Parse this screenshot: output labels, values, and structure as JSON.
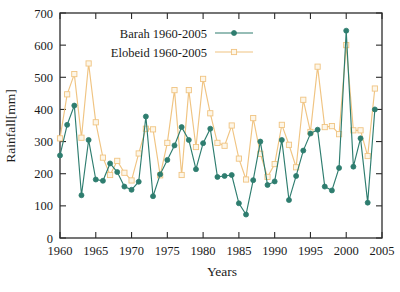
{
  "chart_data": {
    "type": "line",
    "title": "",
    "xlabel": "Years",
    "ylabel": "Rainfall[mm]",
    "xlim": [
      1960,
      2005
    ],
    "ylim": [
      0,
      700
    ],
    "xticks": [
      1960,
      1965,
      1970,
      1975,
      1980,
      1985,
      1990,
      1995,
      2000,
      2005
    ],
    "yticks": [
      0,
      100,
      200,
      300,
      400,
      500,
      600,
      700
    ],
    "grid": false,
    "legend_position": "top-left-inside",
    "x": [
      1960,
      1961,
      1962,
      1963,
      1964,
      1965,
      1966,
      1967,
      1968,
      1969,
      1970,
      1971,
      1972,
      1973,
      1974,
      1975,
      1976,
      1977,
      1978,
      1979,
      1980,
      1981,
      1982,
      1983,
      1984,
      1985,
      1986,
      1987,
      1988,
      1989,
      1990,
      1991,
      1992,
      1993,
      1994,
      1995,
      1996,
      1997,
      1998,
      1999,
      2000,
      2001,
      2002,
      2003,
      2004
    ],
    "series": [
      {
        "name": "Barah 1960-2005",
        "color": "#2e7d6f",
        "marker": "filled-circle",
        "values": [
          257,
          352,
          412,
          133,
          305,
          182,
          178,
          232,
          205,
          160,
          150,
          175,
          378,
          130,
          198,
          243,
          288,
          345,
          305,
          214,
          295,
          340,
          190,
          193,
          196,
          108,
          73,
          180,
          300,
          165,
          176,
          305,
          118,
          193,
          272,
          325,
          337,
          160,
          148,
          218,
          645,
          222,
          310,
          110,
          400
        ]
      },
      {
        "name": "Elobeid 1960-2005",
        "color": "#f0c482",
        "marker": "open-square",
        "values": [
          310,
          447,
          510,
          312,
          543,
          360,
          250,
          196,
          240,
          203,
          179,
          263,
          340,
          338,
          195,
          296,
          460,
          196,
          460,
          283,
          495,
          388,
          296,
          287,
          350,
          247,
          182,
          373,
          262,
          190,
          230,
          352,
          290,
          220,
          430,
          330,
          533,
          345,
          348,
          323,
          600,
          335,
          335,
          255,
          465
        ]
      }
    ]
  },
  "legend": {
    "entries": [
      {
        "label": "Barah 1960-2005",
        "color": "#2e7d6f",
        "marker": "filled-circle"
      },
      {
        "label": "Elobeid 1960-2005",
        "color": "#f0c482",
        "marker": "open-square"
      }
    ]
  }
}
